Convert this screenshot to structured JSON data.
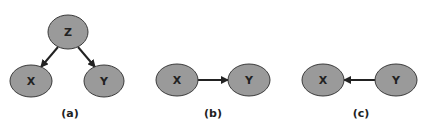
{
  "diagrams": [
    {
      "caption": "(a)",
      "nodes": [
        {
          "id": "Z",
          "label": "Z"
        },
        {
          "id": "X",
          "label": "X"
        },
        {
          "id": "Y",
          "label": "Y"
        }
      ],
      "edges": [
        {
          "from": "Z",
          "to": "X"
        },
        {
          "from": "Z",
          "to": "Y"
        }
      ]
    },
    {
      "caption": "(b)",
      "nodes": [
        {
          "id": "X",
          "label": "X"
        },
        {
          "id": "Y",
          "label": "Y"
        }
      ],
      "edges": [
        {
          "from": "X",
          "to": "Y"
        }
      ]
    },
    {
      "caption": "(c)",
      "nodes": [
        {
          "id": "X",
          "label": "X"
        },
        {
          "id": "Y",
          "label": "Y"
        }
      ],
      "edges": [
        {
          "from": "Y",
          "to": "X"
        }
      ]
    }
  ],
  "colors": {
    "node_fill": "#9a9a9a",
    "node_stroke": "#3a3a3a",
    "edge": "#222222",
    "text": "#222222"
  }
}
